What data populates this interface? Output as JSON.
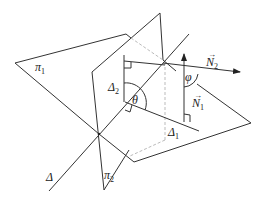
{
  "diagram": {
    "labels": {
      "plane1": "π",
      "plane1_sub": "1",
      "plane2": "π",
      "plane2_sub": "2",
      "line_delta": "Δ",
      "line_delta1": "Δ",
      "line_delta1_sub": "1",
      "line_delta2": "Δ",
      "line_delta2_sub": "2",
      "angle_theta": "θ",
      "angle_phi": "φ",
      "normal1": "N",
      "normal1_sub": "1",
      "normal2": "N",
      "normal2_sub": "2",
      "vector_arrow": "→"
    },
    "colors": {
      "stroke": "#333333",
      "hidden": "#bbbbbb",
      "background": "#ffffff"
    }
  }
}
